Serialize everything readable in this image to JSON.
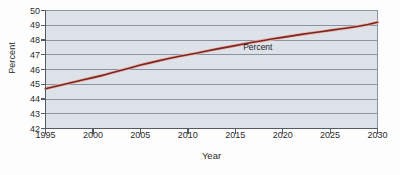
{
  "chart_data": {
    "type": "line",
    "title": "",
    "xlabel": "Year",
    "ylabel": "Percent",
    "xlim": [
      1995,
      2030
    ],
    "ylim": [
      42,
      50
    ],
    "grid": true,
    "grid_axis": "y",
    "legend": "none",
    "annotations": [
      {
        "text": "Percent",
        "x": 2019,
        "y": 47.55
      }
    ],
    "x_ticks": [
      1995,
      2000,
      2005,
      2010,
      2015,
      2020,
      2025,
      2030
    ],
    "y_ticks": [
      42,
      43,
      44,
      45,
      46,
      47,
      48,
      49,
      50
    ],
    "series": [
      {
        "name": "Percent",
        "color": "#7b2620",
        "x": [
          1995,
          1996,
          1997,
          1998,
          1999,
          2000,
          2001,
          2002,
          2003,
          2004,
          2005,
          2006,
          2007,
          2008,
          2009,
          2010,
          2011,
          2012,
          2013,
          2014,
          2015,
          2016,
          2017,
          2018,
          2019,
          2020,
          2021,
          2022,
          2023,
          2024,
          2025,
          2026,
          2027,
          2028,
          2029,
          2030
        ],
        "values": [
          44.7,
          44.85,
          45.0,
          45.15,
          45.3,
          45.45,
          45.6,
          45.78,
          45.95,
          46.12,
          46.3,
          46.45,
          46.6,
          46.75,
          46.88,
          47.0,
          47.12,
          47.25,
          47.38,
          47.5,
          47.62,
          47.74,
          47.86,
          47.97,
          48.08,
          48.18,
          48.28,
          48.38,
          48.47,
          48.56,
          48.65,
          48.74,
          48.83,
          48.93,
          49.05,
          49.2
        ]
      }
    ]
  },
  "axes": {
    "y_title": "Percent",
    "x_title": "Year",
    "y_tick_labels": [
      "50",
      "49",
      "48",
      "47",
      "46",
      "45",
      "44",
      "43",
      "42"
    ],
    "x_tick_labels": [
      "1995",
      "2000",
      "2005",
      "2010",
      "2015",
      "2020",
      "2025",
      "2030"
    ]
  },
  "colors": {
    "plot_background": "#dde2e9",
    "gridline": "#8a939f",
    "axis_line": "#555b63",
    "series_line": "#7b2620",
    "series_halo": "#e9b4ac",
    "text": "#2b2b2b",
    "page_background": "#fdfdfd"
  }
}
